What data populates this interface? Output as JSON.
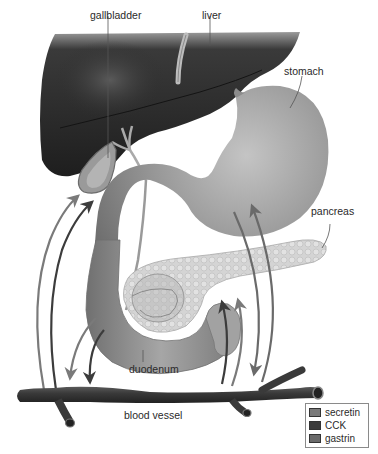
{
  "labels": {
    "gallbladder": "gallbladder",
    "liver": "liver",
    "stomach": "stomach",
    "pancreas": "pancreas",
    "duodenum": "duodenum",
    "blood_vessel": "blood vessel"
  },
  "legend": {
    "items": [
      {
        "label": "secretin",
        "color": "#7a7a7a"
      },
      {
        "label": "CCK",
        "color": "#3c3c3c"
      },
      {
        "label": "gastrin",
        "color": "#6a6a6a"
      }
    ]
  },
  "colors": {
    "liver": "#2f2f2f",
    "stomach": "#8c8c8c",
    "pancreas": "#cfcfcf",
    "blood_vessel": "#3a3a3a",
    "arrow_secretin": "#7a7a7a",
    "arrow_cck": "#3c3c3c",
    "arrow_gastrin": "#6a6a6a"
  }
}
